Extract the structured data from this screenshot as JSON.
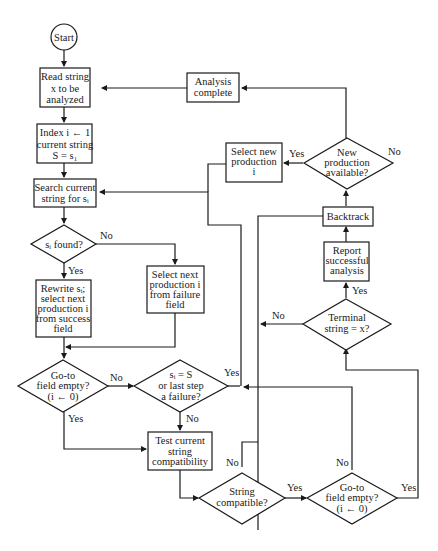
{
  "diagram": {
    "type": "flowchart",
    "nodes": {
      "start": {
        "label": "Start"
      },
      "read_string": {
        "lines": [
          "Read string",
          "x to be",
          "analyzed"
        ]
      },
      "index_init": {
        "lines": [
          "Index i ← 1",
          "current string",
          "S = s₁"
        ]
      },
      "search": {
        "lines": [
          "Search current",
          "string for sᵢ"
        ]
      },
      "si_found": {
        "lines": [
          "sᵢ found?"
        ]
      },
      "rewrite": {
        "lines": [
          "Rewrite sᵢ;",
          "select next",
          "production i",
          "from success",
          "field"
        ]
      },
      "select_failure": {
        "lines": [
          "Select next",
          "production i",
          "from failure",
          "field"
        ]
      },
      "goto_empty_1": {
        "lines": [
          "Go-to",
          "field empty?",
          "(i ← 0)"
        ]
      },
      "si_equals_s": {
        "lines": [
          "sᵢ = S",
          "or last step",
          "a failure?"
        ]
      },
      "test_compat": {
        "lines": [
          "Test current",
          "string",
          "compatibility"
        ]
      },
      "string_compat": {
        "lines": [
          "String",
          "compatible?"
        ]
      },
      "goto_empty_2": {
        "lines": [
          "Go-to",
          "field empty?",
          "(i ← 0)"
        ]
      },
      "terminal": {
        "lines": [
          "Terminal",
          "string = x?"
        ]
      },
      "report": {
        "lines": [
          "Report",
          "successful",
          "analysis"
        ]
      },
      "backtrack": {
        "lines": [
          "Backtrack"
        ]
      },
      "new_prod_avail": {
        "lines": [
          "New",
          "production",
          "available?"
        ]
      },
      "select_new": {
        "lines": [
          "Select new",
          "production",
          "i"
        ]
      },
      "analysis_complete": {
        "lines": [
          "Analysis",
          "complete"
        ]
      }
    },
    "edge_labels": {
      "si_found_no": "No",
      "si_found_yes": "Yes",
      "goto1_no": "No",
      "goto1_yes": "Yes",
      "si_eq_yes": "Yes",
      "si_eq_no": "No",
      "compat_no": "No",
      "compat_yes": "Yes",
      "goto2_no": "No",
      "goto2_yes": "Yes",
      "terminal_no": "No",
      "terminal_yes": "Yes",
      "newprod_yes": "Yes",
      "newprod_no": "No"
    }
  }
}
